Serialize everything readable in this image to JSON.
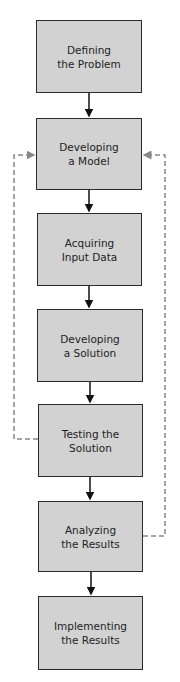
{
  "diagram": {
    "type": "flowchart",
    "colors": {
      "box_fill": "#d2d2d2",
      "box_border": "#2a2a2a",
      "arrow": "#111111",
      "feedback": "#888888"
    },
    "steps": [
      {
        "line1": "Defining",
        "line2": "the Problem"
      },
      {
        "line1": "Developing",
        "line2": "a Model"
      },
      {
        "line1": "Acquiring",
        "line2": "Input Data"
      },
      {
        "line1": "Developing",
        "line2": "a Solution"
      },
      {
        "line1": "Testing the",
        "line2": "Solution"
      },
      {
        "line1": "Analyzing",
        "line2": "the Results"
      },
      {
        "line1": "Implementing",
        "line2": "the Results"
      }
    ],
    "feedback_loops": [
      {
        "from": "Testing the Solution",
        "to": "Developing a Model",
        "side": "left",
        "style": "dashed"
      },
      {
        "from": "Analyzing the Results",
        "to": "Developing a Model",
        "side": "right",
        "style": "dashed"
      }
    ]
  }
}
